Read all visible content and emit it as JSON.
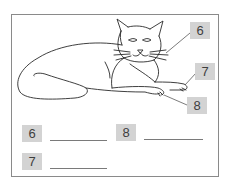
{
  "diagram": {
    "callouts": [
      {
        "number": "6",
        "target": "whiskers"
      },
      {
        "number": "7",
        "target": "front paw (right)"
      },
      {
        "number": "8",
        "target": "front paw claws (left)"
      }
    ]
  },
  "answers": [
    {
      "number": "6",
      "value": ""
    },
    {
      "number": "8",
      "value": ""
    },
    {
      "number": "7",
      "value": ""
    }
  ],
  "colors": {
    "tag_background": "#d3d3d3",
    "tag_text": "#3e3e3e",
    "line": "#333333",
    "frame": "#8a8a8a"
  }
}
